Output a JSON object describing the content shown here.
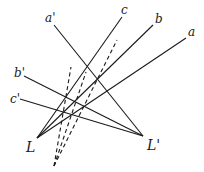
{
  "diagram": {
    "stroke_color": "#1a1a1a",
    "points": {
      "L": {
        "label": "L",
        "x": 37,
        "y": 138
      },
      "L_prime": {
        "label": "L'",
        "x": 143,
        "y": 136
      },
      "dash_apex": {
        "x": 54,
        "y": 166
      }
    },
    "lines": [
      {
        "name": "a",
        "label": "a",
        "from": [
          186,
          38
        ],
        "to": "L",
        "style": "solid"
      },
      {
        "name": "b",
        "label": "b",
        "from": [
          153,
          25
        ],
        "to": "L",
        "style": "solid"
      },
      {
        "name": "c",
        "label": "c",
        "from": [
          122,
          17
        ],
        "to": "L",
        "style": "solid"
      },
      {
        "name": "a-prime",
        "label": "a'",
        "from": [
          54,
          25
        ],
        "to": "L_prime",
        "style": "solid"
      },
      {
        "name": "b-prime",
        "label": "b'",
        "from": [
          24,
          76
        ],
        "to": "L_prime",
        "style": "solid"
      },
      {
        "name": "c-prime",
        "label": "c'",
        "from": [
          20,
          99
        ],
        "to": "L_prime",
        "style": "solid"
      }
    ],
    "dashed_lines": [
      {
        "from": [
          54,
          166
        ],
        "to": [
          71,
          67
        ]
      },
      {
        "from": [
          54,
          166
        ],
        "to": [
          86,
          72
        ]
      },
      {
        "from": [
          54,
          166
        ],
        "to": [
          117,
          40
        ]
      }
    ],
    "labels": {
      "a": "a",
      "b": "b",
      "c": "c",
      "a_prime": "a'",
      "b_prime": "b'",
      "c_prime": "c'",
      "L": "L",
      "L_prime": "L'"
    }
  }
}
